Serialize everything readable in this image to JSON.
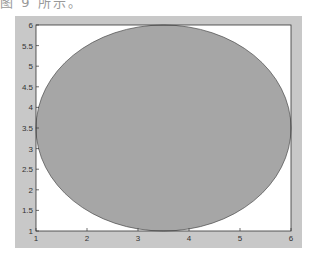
{
  "caption_fragment": "图 9 所示。",
  "chart_data": {
    "type": "area",
    "title": "",
    "xlabel": "",
    "ylabel": "",
    "xlim": [
      1,
      6
    ],
    "ylim": [
      1,
      6
    ],
    "x_ticks": [
      "1",
      "2",
      "3",
      "4",
      "5",
      "6"
    ],
    "y_ticks": [
      "1",
      "1.5",
      "2",
      "2.5",
      "3",
      "3.5",
      "4",
      "4.5",
      "5",
      "5.5",
      "6"
    ],
    "grid": false,
    "legend": null,
    "shapes": [
      {
        "shape": "ellipse",
        "center": [
          3.5,
          3.5
        ],
        "radius_x": 2.5,
        "radius_y": 2.5,
        "fill": "#a6a6a6",
        "edge": "#4a4a4a"
      }
    ]
  },
  "colors": {
    "figure_bg": "#c8c8c8",
    "axes_bg": "#ffffff",
    "fill": "#a6a6a6",
    "edge": "#4a4a4a"
  }
}
